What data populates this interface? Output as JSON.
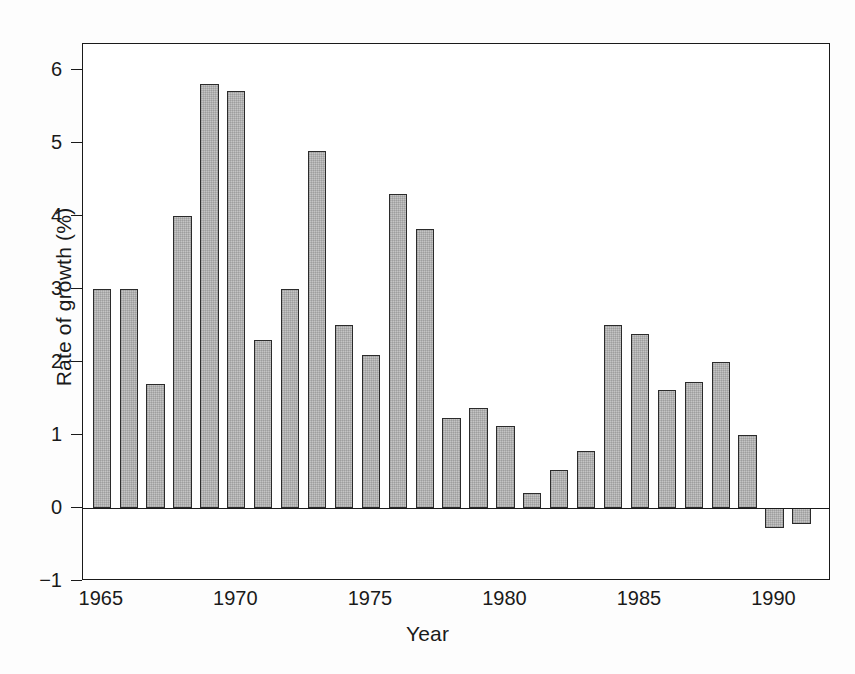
{
  "chart_data": {
    "type": "bar",
    "title": "",
    "xlabel": "Year",
    "ylabel": "Rate of growth (%)",
    "categories": [
      1965,
      1966,
      1967,
      1968,
      1969,
      1970,
      1971,
      1972,
      1973,
      1974,
      1975,
      1976,
      1977,
      1978,
      1979,
      1980,
      1981,
      1982,
      1983,
      1984,
      1985,
      1986,
      1987,
      1988,
      1989,
      1990,
      1991
    ],
    "values": [
      3.0,
      3.0,
      1.7,
      4.0,
      5.8,
      5.7,
      2.3,
      3.0,
      4.88,
      2.5,
      2.1,
      4.3,
      3.82,
      1.23,
      1.37,
      1.12,
      0.2,
      0.52,
      0.78,
      2.5,
      2.38,
      1.62,
      1.72,
      2.0,
      1.0,
      -0.28,
      -0.22
    ],
    "ylim": [
      -1,
      6.35
    ],
    "xlim": [
      1964.3,
      1992.1
    ],
    "yticks": [
      -1,
      0,
      1,
      2,
      3,
      4,
      5,
      6
    ],
    "ytick_labels": [
      "−1",
      "0",
      "1",
      "2",
      "3",
      "4",
      "5",
      "6"
    ],
    "xticks": [
      1965,
      1970,
      1975,
      1980,
      1985,
      1990
    ],
    "xtick_labels": [
      "1965",
      "1970",
      "1975",
      "1980",
      "1985",
      "1990"
    ],
    "grid": false,
    "legend": null,
    "bar_face_color": "#c4c4c4",
    "bar_edge_color": "#2b2b2b",
    "axis_color": "#1a1a1a",
    "background_color": "#ffffff"
  }
}
